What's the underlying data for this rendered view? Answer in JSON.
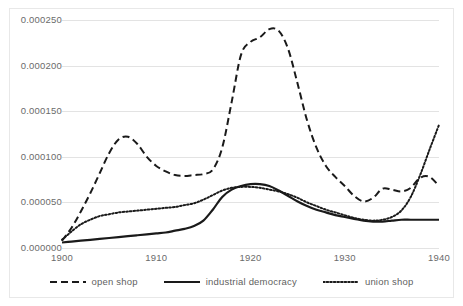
{
  "chart_data": {
    "type": "line",
    "title": "",
    "xlabel": "",
    "ylabel": "",
    "xlim": [
      1900,
      1940
    ],
    "ylim": [
      0.0,
      0.00025
    ],
    "grid": true,
    "legend_position": "bottom",
    "xticks": [
      "1900",
      "1910",
      "1920",
      "1930",
      "1940"
    ],
    "yticks": [
      "0.000000",
      "0.000050",
      "0.000100",
      "0.000150",
      "0.000200",
      "0.000250"
    ],
    "x": [
      1900,
      1901,
      1902,
      1903,
      1904,
      1905,
      1906,
      1907,
      1908,
      1909,
      1910,
      1911,
      1912,
      1913,
      1914,
      1915,
      1916,
      1917,
      1918,
      1919,
      1920,
      1921,
      1922,
      1923,
      1924,
      1925,
      1926,
      1927,
      1928,
      1929,
      1930,
      1931,
      1932,
      1933,
      1934,
      1935,
      1936,
      1937,
      1938,
      1939,
      1940
    ],
    "series": [
      {
        "name": "open shop",
        "style": "dashed",
        "color": "#1a1a1a",
        "values": [
          8e-06,
          2.2e-05,
          4e-05,
          6e-05,
          8.2e-05,
          0.000104,
          0.000119,
          0.000122,
          0.000114,
          0.0001,
          9e-05,
          8.4e-05,
          8e-05,
          7.9e-05,
          8e-05,
          8.1e-05,
          8.6e-05,
          0.00011,
          0.00016,
          0.000212,
          0.000226,
          0.000231,
          0.00024,
          0.000238,
          0.000218,
          0.00018,
          0.00014,
          0.00011,
          9e-05,
          7.8e-05,
          6.8e-05,
          5.7e-05,
          5.1e-05,
          5.5e-05,
          6.5e-05,
          6.4e-05,
          6.2e-05,
          6.6e-05,
          7.7e-05,
          7.8e-05,
          6.8e-05
        ]
      },
      {
        "name": "industrial democracy",
        "style": "solid",
        "color": "#1a1a1a",
        "values": [
          6e-06,
          7e-06,
          8e-06,
          9e-06,
          1e-05,
          1.1e-05,
          1.2e-05,
          1.3e-05,
          1.4e-05,
          1.5e-05,
          1.6e-05,
          1.7e-05,
          1.9e-05,
          2.1e-05,
          2.4e-05,
          3e-05,
          4.2e-05,
          5.6e-05,
          6.4e-05,
          6.8e-05,
          7e-05,
          7e-05,
          6.8e-05,
          6.3e-05,
          5.7e-05,
          5.1e-05,
          4.6e-05,
          4.2e-05,
          3.9e-05,
          3.6e-05,
          3.4e-05,
          3.2e-05,
          3e-05,
          2.9e-05,
          2.9e-05,
          3e-05,
          3.1e-05,
          3.1e-05,
          3.1e-05,
          3.1e-05,
          3.1e-05
        ]
      },
      {
        "name": "union shop",
        "style": "dotted",
        "color": "#1a1a1a",
        "values": [
          9e-06,
          1.8e-05,
          2.6e-05,
          3.1e-05,
          3.5e-05,
          3.7e-05,
          3.9e-05,
          4e-05,
          4.1e-05,
          4.2e-05,
          4.3e-05,
          4.4e-05,
          4.5e-05,
          4.7e-05,
          4.9e-05,
          5.3e-05,
          5.8e-05,
          6.3e-05,
          6.6e-05,
          6.7e-05,
          6.7e-05,
          6.6e-05,
          6.4e-05,
          6.2e-05,
          5.9e-05,
          5.5e-05,
          5e-05,
          4.6e-05,
          4.2e-05,
          3.9e-05,
          3.6e-05,
          3.3e-05,
          3.1e-05,
          3e-05,
          3.1e-05,
          3.4e-05,
          4.1e-05,
          5.6e-05,
          8e-05,
          0.000108,
          0.000135
        ]
      }
    ],
    "legend": [
      {
        "label": "open shop",
        "style": "dashed"
      },
      {
        "label": "industrial democracy",
        "style": "solid"
      },
      {
        "label": "union shop",
        "style": "dotted"
      }
    ]
  }
}
